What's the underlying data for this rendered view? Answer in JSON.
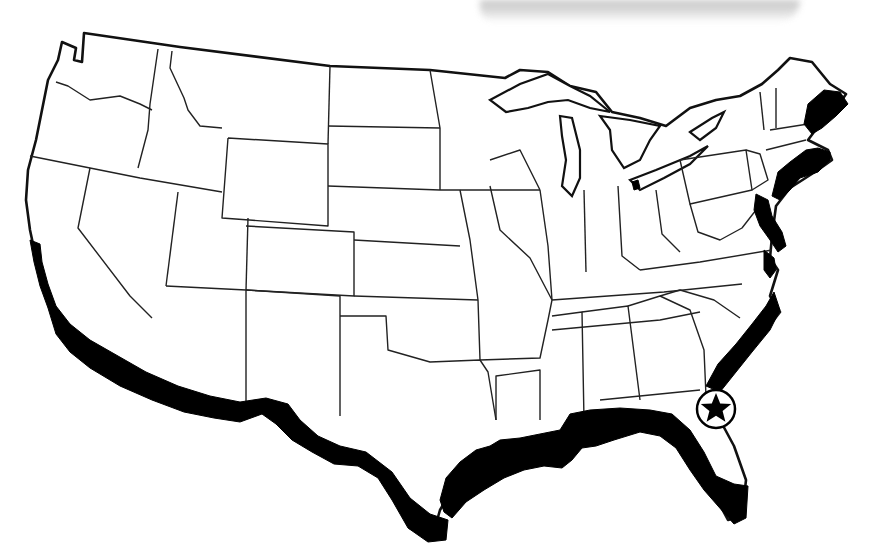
{
  "map": {
    "subject": "Contiguous United States outline map with state borders",
    "highlight": {
      "label": "Shaded coastal region",
      "areas": [
        "California coast (southern)",
        "Gulf of Mexico coast (Texas to Florida)",
        "Atlantic coast (Florida to Maine)"
      ],
      "color": "#000000"
    },
    "marker": {
      "icon": "star-in-circle",
      "location": "Northeast Florida (Atlantic coast)",
      "color": "#000000"
    },
    "background": "#ffffff",
    "outline_color": "#111111"
  }
}
